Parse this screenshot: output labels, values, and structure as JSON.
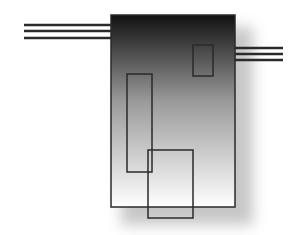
{
  "diagram": {
    "type": "abstract-block-diagram",
    "colors": {
      "background": "#ffffff",
      "stroke": "#2a2a2a",
      "gradient_top": "#111111",
      "gradient_bottom": "#ffffff",
      "shadow": "#bdbdbd"
    },
    "main_block": {
      "x": 111,
      "y": 15,
      "width": 124,
      "height": 192
    },
    "left_lines": {
      "x1": 24,
      "x2": 111,
      "ys": [
        25,
        31,
        38
      ]
    },
    "right_lines": {
      "x1": 235,
      "x2": 283,
      "ys": [
        48,
        54,
        60
      ]
    },
    "inner_rects": [
      {
        "name": "small-top-right-rect",
        "x": 193,
        "y": 45,
        "width": 20,
        "height": 31
      },
      {
        "name": "tall-left-rect",
        "x": 127,
        "y": 74,
        "width": 25,
        "height": 98
      },
      {
        "name": "bottom-overlap-rect",
        "x": 148,
        "y": 150,
        "width": 45,
        "height": 68
      }
    ]
  }
}
